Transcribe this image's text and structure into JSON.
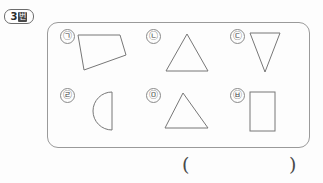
{
  "badge": {
    "number": "3",
    "unit": "번"
  },
  "figure_box": {
    "name": "shape-collection-box",
    "items": [
      {
        "label": "㉠",
        "shape_name": "quadrilateral",
        "description": "quadrilateral with vertical left edge tapering to a point on the right"
      },
      {
        "label": "㉡",
        "shape_name": "triangle",
        "description": "upright isosceles triangle"
      },
      {
        "label": "㉢",
        "shape_name": "inverted-triangle",
        "description": "narrow downward pointing triangle"
      },
      {
        "label": "㉣",
        "shape_name": "semicircle",
        "description": "half circle with flat vertical edge on the right"
      },
      {
        "label": "㉤",
        "shape_name": "scalene-triangle",
        "description": "triangle with apex shifted to the left"
      },
      {
        "label": "㉥",
        "shape_name": "rectangle",
        "description": "tall vertical rectangle"
      }
    ]
  },
  "answer": {
    "open_paren": "(",
    "close_paren": ")",
    "value": ""
  }
}
